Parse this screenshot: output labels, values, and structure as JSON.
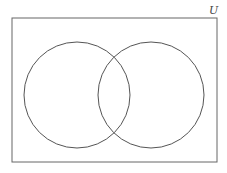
{
  "diagram": {
    "type": "venn",
    "universe_label": "U",
    "sets": [
      {
        "name": "left-set",
        "cx": 77,
        "cy": 95,
        "r": 53
      },
      {
        "name": "right-set",
        "cx": 151,
        "cy": 95,
        "r": 53
      }
    ],
    "stroke_color": "#555555"
  }
}
